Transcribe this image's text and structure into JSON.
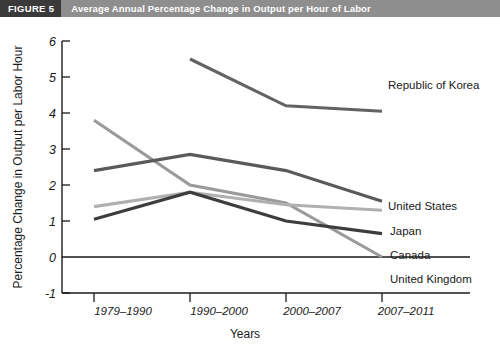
{
  "figure": {
    "tag": "FIGURE 5",
    "title": "Average Annual Percentage Change in Output per Hour of Labor",
    "tag_bg": "#3a3a3a",
    "bar_bg": "#8e8e8e"
  },
  "axes": {
    "ylabel": "Percentage Change in Output per Labor Hour",
    "xlabel": "Years",
    "yticks": [
      "-1",
      "0",
      "1",
      "2",
      "3",
      "4",
      "5",
      "6"
    ],
    "xticks": [
      "1979–1990",
      "1990–2000",
      "2000–2007",
      "2007–2011"
    ]
  },
  "series_labels": {
    "korea": "Republic of Korea",
    "united_states": "United States",
    "japan": "Japan",
    "canada": "Canada",
    "united_kingdom": "United Kingdom"
  },
  "chart_data": {
    "type": "line",
    "title": "Average Annual Percentage Change in Output per Hour of Labor",
    "xlabel": "Years",
    "ylabel": "Percentage Change in Output per Labor Hour",
    "categories": [
      "1979–1990",
      "1990–2000",
      "2000–2007",
      "2007–2011"
    ],
    "ylim": [
      -1,
      6
    ],
    "ytick_step": 1,
    "grid": false,
    "legend": "inline-right-of-line-ends",
    "series": [
      {
        "name": "Republic of Korea",
        "color": "#636363",
        "values": [
          null,
          5.5,
          4.2,
          4.05
        ]
      },
      {
        "name": "United States",
        "color": "#5a5a5a",
        "values": [
          2.4,
          2.85,
          2.4,
          1.55
        ]
      },
      {
        "name": "Japan",
        "color": "#b0b0b0",
        "values": [
          1.4,
          1.8,
          1.45,
          1.3
        ]
      },
      {
        "name": "Canada",
        "color": "#3d3d3d",
        "values": [
          1.05,
          1.8,
          1.0,
          0.65
        ]
      },
      {
        "name": "United Kingdom",
        "color": "#9a9a9a",
        "values": [
          3.8,
          2.0,
          1.5,
          0.0
        ]
      }
    ]
  }
}
